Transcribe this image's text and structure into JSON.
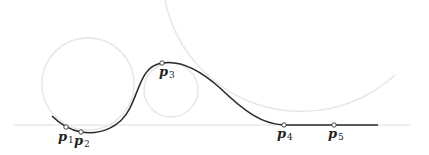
{
  "diagram": {
    "type": "curve-with-osculating-circles",
    "colors": {
      "curve": "#2a2a2a",
      "guide": "#e4e4e4",
      "baseline": "#e8e8e8",
      "point_fill": "#ffffff",
      "point_stroke": "#333333"
    },
    "points": [
      {
        "name": "p",
        "sub": "1",
        "x": 66,
        "y": 127
      },
      {
        "name": "p",
        "sub": "2",
        "x": 81,
        "y": 132
      },
      {
        "name": "p",
        "sub": "3",
        "x": 162,
        "y": 63
      },
      {
        "name": "p",
        "sub": "4",
        "x": 284,
        "y": 125
      },
      {
        "name": "p",
        "sub": "5",
        "x": 334,
        "y": 125
      }
    ],
    "circles": [
      {
        "cx": 88,
        "cy": 84,
        "r": 46
      },
      {
        "cx": 171,
        "cy": 90,
        "r": 27
      },
      {
        "cx": 300,
        "cy": -14,
        "r": 139
      }
    ],
    "baseline": {
      "x1": 14,
      "x2": 410,
      "y": 125
    }
  }
}
